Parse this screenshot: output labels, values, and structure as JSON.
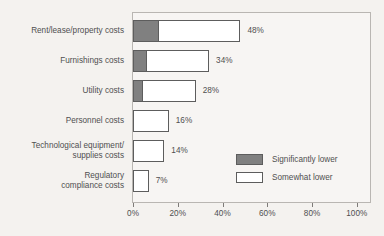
{
  "chart_data": {
    "type": "bar",
    "orientation": "horizontal",
    "stacked": true,
    "title": "",
    "xlabel": "",
    "ylabel": "",
    "xlim": [
      0,
      100
    ],
    "grid": false,
    "legend_position": "inside-right-lower",
    "categories": [
      "Rent/lease/property costs",
      "Furnishings costs",
      "Utility costs",
      "Personnel costs",
      "Technological equipment/\nsupplies costs",
      "Regulatory\ncompliance costs"
    ],
    "series": [
      {
        "name": "Significantly lower",
        "color": "#808080",
        "values": [
          11,
          6,
          4,
          0,
          0,
          0
        ]
      },
      {
        "name": "Somewhat lower",
        "color": "#ffffff",
        "values": [
          37,
          28,
          24,
          16,
          14,
          7
        ]
      }
    ],
    "totals": [
      48,
      34,
      28,
      16,
      14,
      7
    ],
    "total_labels": [
      "48%",
      "34%",
      "28%",
      "16%",
      "14%",
      "7%"
    ],
    "xticks": [
      0,
      20,
      40,
      60,
      80,
      100
    ],
    "xtick_labels": [
      "0%",
      "20%",
      "40%",
      "60%",
      "80%",
      "100%"
    ]
  },
  "legend": {
    "items": [
      {
        "label": "Significantly lower",
        "swatch": "dark"
      },
      {
        "label": "Somewhat lower",
        "swatch": "light"
      }
    ]
  }
}
